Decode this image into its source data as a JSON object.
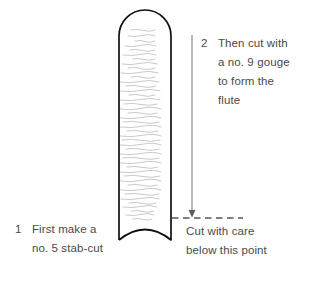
{
  "figure": {
    "colors": {
      "outline": "#111111",
      "grain": "#b9b9b9",
      "text": "#4a4a4a",
      "arrow": "#8e8e8e",
      "dashed_line": "#555555",
      "background": "#ffffff"
    }
  },
  "steps": [
    {
      "number": "1",
      "lines": [
        "First make a",
        "no. 5 stab-cut"
      ],
      "text": "First make a\nno. 5 stab-cut",
      "position": "bottom-left"
    },
    {
      "number": "2",
      "lines": [
        "Then cut with",
        "a no. 9 gouge",
        "to form the",
        "flute"
      ],
      "text": "Then cut with\na no. 9 gouge\nto form the\nflute",
      "position": "top-right"
    }
  ],
  "caution": {
    "lines": [
      "Cut with care",
      "below this point"
    ],
    "text": "Cut with care\nbelow this point"
  },
  "annotations": {
    "arrow": {
      "name": "downward-direction-arrow",
      "direction": "down",
      "from_y": 35,
      "to_y": 218
    },
    "dashed_line": {
      "name": "cut-limit-dashed-line",
      "from_x": 172,
      "to_x": 243,
      "y": 218
    }
  }
}
